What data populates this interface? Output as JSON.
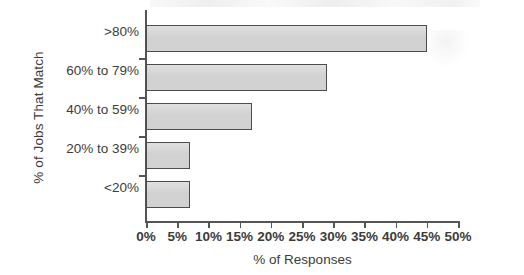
{
  "chart_data": {
    "type": "bar",
    "orientation": "horizontal",
    "title": "",
    "xlabel": "% of Responses",
    "ylabel": "% of Jobs That Match",
    "categories": [
      "<20%",
      "20% to 39%",
      "40% to 59%",
      "60% to 79%",
      ">80%"
    ],
    "values": [
      7,
      7,
      17,
      29,
      45
    ],
    "xlim": [
      0,
      50
    ],
    "xticks": [
      0,
      5,
      10,
      15,
      20,
      25,
      30,
      35,
      40,
      45,
      50
    ],
    "xtick_labels": [
      "0%",
      "5%",
      "10%",
      "15%",
      "20%",
      "25%",
      "30%",
      "35%",
      "40%",
      "45%",
      "50%"
    ],
    "grid": false,
    "legend": null,
    "bar_fill_color": "#d2d2d2",
    "bar_border_color": "#4c4c4c",
    "axis_color": "#555555",
    "text_color": "#3c3c3c",
    "background_color": "#ffffff"
  }
}
